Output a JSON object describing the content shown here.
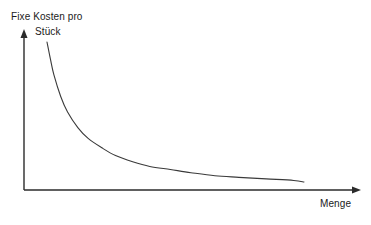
{
  "chart_data": {
    "type": "line",
    "title": "",
    "subtitle": "",
    "ylabel_line1": "Fixe Kosten pro",
    "ylabel_line2": "Stück",
    "ylabel": "Fixe Kosten pro Stück",
    "xlabel": "Menge",
    "grid": false,
    "legend": false,
    "legend_position": "none",
    "xticks": [],
    "yticks": [],
    "xticklabels": [],
    "yticklabels": [],
    "xlim": [
      0,
      100
    ],
    "ylim": [
      0,
      100
    ],
    "annotations": [],
    "series": [
      {
        "name": "Fixe Kosten pro Stück",
        "color": "#3a3a3a",
        "x": [
          8,
          9,
          10,
          12,
          14,
          17,
          20,
          24,
          28,
          33,
          38,
          44,
          50,
          57,
          64,
          72,
          80,
          83
        ],
        "y": [
          99,
          88,
          78,
          64,
          54,
          44,
          37,
          31,
          26,
          22,
          19,
          17,
          15,
          13,
          12,
          11,
          10,
          9
        ]
      }
    ],
    "axes": {
      "y_axis": {
        "x": 24,
        "y_top": 30,
        "y_bottom": 190,
        "arrow": "up"
      },
      "x_axis": {
        "y": 190,
        "x_left": 24,
        "x_right": 360,
        "arrow": "right"
      },
      "axis_color": "#2b2b2b"
    },
    "curve_pixels": {
      "start": [
        47,
        42
      ],
      "end": [
        304,
        182
      ],
      "knee": [
        75,
        130
      ]
    }
  }
}
